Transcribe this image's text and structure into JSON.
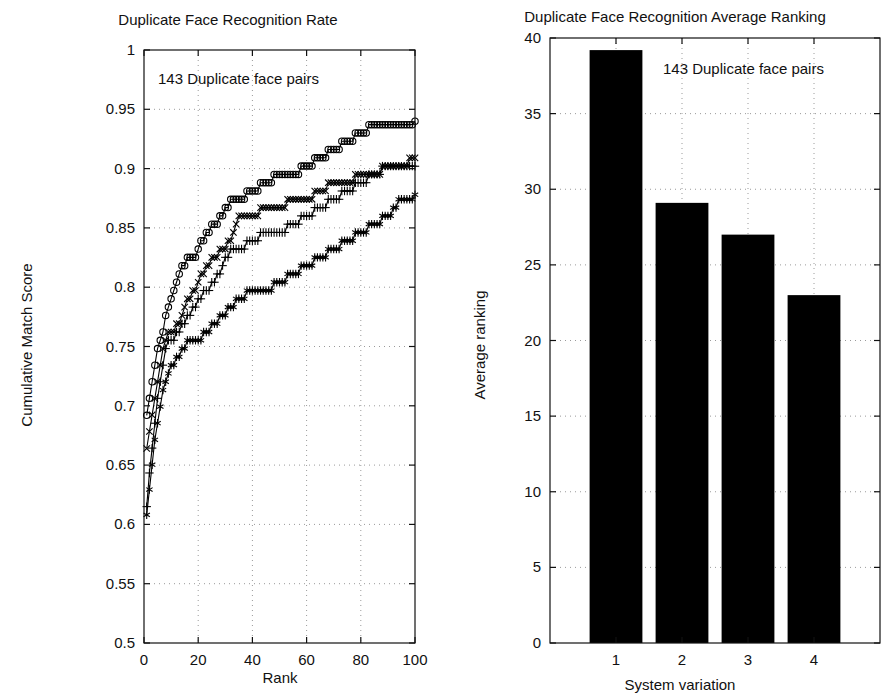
{
  "figure": {
    "background": "#ffffff",
    "ink_color": "#000000",
    "grid_color": "#9a9a9a"
  },
  "chart_data": [
    {
      "type": "line",
      "panel": "left",
      "title": "Duplicate Face Recognition Rate",
      "xlabel": "Rank",
      "ylabel": "Cumulative Match Score",
      "annotation": "143 Duplicate face pairs",
      "xlim": [
        0,
        100
      ],
      "ylim": [
        0.5,
        1
      ],
      "xticks": [
        0,
        20,
        40,
        60,
        80,
        100
      ],
      "xticklabels": [
        "0",
        "20",
        "40",
        "60",
        "80",
        "100"
      ],
      "yticks": [
        0.5,
        0.55,
        0.6,
        0.65,
        0.7,
        0.75,
        0.8,
        0.85,
        0.9,
        0.95,
        1
      ],
      "yticklabels": [
        "0.5",
        "0.55",
        "0.6",
        "0.65",
        "0.7",
        "0.75",
        "0.8",
        "0.85",
        "0.9",
        "0.95",
        "1"
      ],
      "grid": true,
      "legend": "none",
      "x": [
        1,
        2,
        3,
        4,
        5,
        6,
        7,
        8,
        9,
        10,
        12,
        14,
        16,
        18,
        20,
        23,
        26,
        29,
        32,
        35,
        40,
        45,
        50,
        55,
        60,
        65,
        70,
        75,
        80,
        85,
        90,
        95,
        100
      ],
      "series": [
        {
          "name": "circle-series",
          "marker": "o",
          "values": [
            0.692,
            0.706,
            0.72,
            0.734,
            0.748,
            0.755,
            0.762,
            0.776,
            0.783,
            0.79,
            0.804,
            0.818,
            0.825,
            0.825,
            0.832,
            0.846,
            0.853,
            0.86,
            0.874,
            0.874,
            0.881,
            0.888,
            0.895,
            0.895,
            0.902,
            0.909,
            0.916,
            0.923,
            0.93,
            0.937,
            0.937,
            0.94,
            0.94
          ]
        },
        {
          "name": "cross-series",
          "marker": "x",
          "values": [
            0.664,
            0.678,
            0.692,
            0.706,
            0.72,
            0.734,
            0.748,
            0.755,
            0.762,
            0.762,
            0.769,
            0.776,
            0.79,
            0.797,
            0.804,
            0.818,
            0.825,
            0.832,
            0.839,
            0.86,
            0.86,
            0.867,
            0.867,
            0.874,
            0.874,
            0.881,
            0.888,
            0.888,
            0.895,
            0.895,
            0.902,
            0.902,
            0.909
          ]
        },
        {
          "name": "plus-series",
          "marker": "+",
          "values": [
            0.615,
            0.643,
            0.664,
            0.685,
            0.706,
            0.72,
            0.734,
            0.748,
            0.755,
            0.755,
            0.762,
            0.769,
            0.776,
            0.783,
            0.79,
            0.797,
            0.804,
            0.818,
            0.832,
            0.832,
            0.839,
            0.846,
            0.846,
            0.853,
            0.86,
            0.867,
            0.874,
            0.881,
            0.888,
            0.895,
            0.902,
            0.902,
            0.902
          ]
        },
        {
          "name": "asterisk-series",
          "marker": "*",
          "values": [
            0.608,
            0.629,
            0.65,
            0.671,
            0.685,
            0.699,
            0.713,
            0.72,
            0.727,
            0.734,
            0.741,
            0.748,
            0.755,
            0.755,
            0.755,
            0.762,
            0.769,
            0.776,
            0.783,
            0.79,
            0.797,
            0.797,
            0.804,
            0.811,
            0.818,
            0.825,
            0.832,
            0.839,
            0.846,
            0.853,
            0.86,
            0.874,
            0.878
          ]
        }
      ]
    },
    {
      "type": "bar",
      "panel": "right",
      "title": "Duplicate Face Recognition Average Ranking",
      "xlabel": "System variation",
      "ylabel": "Average ranking",
      "annotation": "143 Duplicate face pairs",
      "categories": [
        "1",
        "2",
        "3",
        "4"
      ],
      "values": [
        39.2,
        29.1,
        27.0,
        23.0
      ],
      "ylim": [
        0,
        40
      ],
      "yticks": [
        0,
        5,
        10,
        15,
        20,
        25,
        30,
        35,
        40
      ],
      "yticklabels": [
        "0",
        "5",
        "10",
        "15",
        "20",
        "25",
        "30",
        "35",
        "40"
      ],
      "grid": true,
      "legend": "none",
      "bar_color": "#000000"
    }
  ]
}
